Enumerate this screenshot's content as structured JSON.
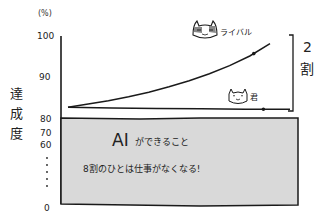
{
  "chart_data": {
    "type": "line",
    "title": "",
    "unit_label": "(%)",
    "ylabel": "達成度",
    "xlabel": "",
    "yticks": [
      "100",
      "90",
      "80",
      "70",
      "60",
      "0"
    ],
    "ylim": [
      80,
      100
    ],
    "axis_break": true,
    "grid": false,
    "series": [
      {
        "name": "ライバル",
        "marker_label": "ライバル",
        "x": [
          0,
          0.1,
          0.2,
          0.3,
          0.4,
          0.5,
          0.6,
          0.7,
          0.8,
          0.9,
          1.0
        ],
        "values": [
          81.5,
          82.3,
          83.2,
          84.2,
          85.4,
          86.8,
          88.4,
          90.2,
          92.3,
          94.8,
          98
        ],
        "highlight_x": 0.92
      },
      {
        "name": "君",
        "marker_label": "君",
        "x": [
          0,
          0.2,
          0.4,
          0.6,
          0.8,
          1.0
        ],
        "values": [
          81.5,
          81.3,
          81.2,
          81.1,
          81.0,
          81.0
        ],
        "highlight_x": 0.88
      }
    ],
    "annotations": {
      "gap_bracket_label_top": "2",
      "gap_bracket_label_bottom": "割",
      "box_title": "AIができること",
      "box_subtitle": "8割のひとは仕事がなくなる!"
    },
    "colors": {
      "ink": "#1a1a1a",
      "box_fill": "#d9d9d9",
      "background": "#ffffff"
    }
  }
}
